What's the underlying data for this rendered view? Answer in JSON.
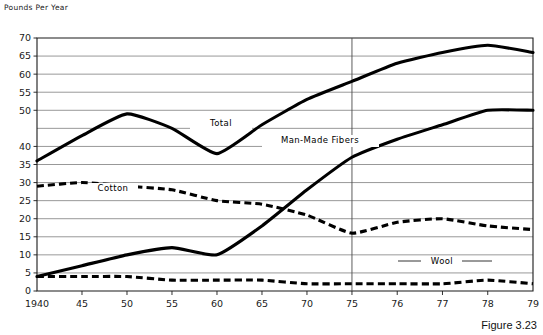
{
  "axis_title": "Pounds Per Year",
  "caption": "Figure 3.23",
  "chart_data": {
    "type": "line",
    "title": "",
    "subtitle": "",
    "xlabel": "",
    "ylabel": "Pounds Per Year",
    "ylim": [
      0,
      70
    ],
    "grid": true,
    "legend_position": "inline-annotations",
    "note": "Horizontal axis uses 5-year spacing from 1940 to 1975, then 1-year spacing from 1975 to 1979; a vertical rule marks the 1975 scale change.",
    "x_tick_labels": [
      "1940",
      "45",
      "50",
      "55",
      "60",
      "65",
      "70",
      "75",
      "76",
      "77",
      "78",
      "79"
    ],
    "x_values": [
      1940,
      1945,
      1950,
      1955,
      1960,
      1965,
      1970,
      1975,
      1976,
      1977,
      1978,
      1979
    ],
    "y_tick_labels": [
      "0",
      "5",
      "10",
      "15",
      "20",
      "25",
      "30",
      "35",
      "40",
      "50",
      "55",
      "60",
      "65",
      "70"
    ],
    "y_tick_values": [
      0,
      5,
      10,
      15,
      20,
      25,
      30,
      35,
      40,
      50,
      55,
      60,
      65,
      70
    ],
    "y_gridline_values": [
      0,
      5,
      10,
      15,
      20,
      25,
      30,
      35,
      40,
      45,
      50,
      55,
      60,
      65,
      70
    ],
    "divider_x": 1975,
    "series": [
      {
        "name": "Total",
        "style": "solid",
        "label": "Total",
        "values": [
          36,
          43,
          49,
          45,
          38,
          46,
          53,
          58,
          63,
          66,
          68,
          66
        ]
      },
      {
        "name": "Man-Made Fibers",
        "style": "solid",
        "label": "Man-Made Fibers",
        "values": [
          4,
          7,
          10,
          12,
          10,
          18,
          28,
          37,
          42,
          46,
          50,
          50
        ]
      },
      {
        "name": "Cotton",
        "style": "dashed",
        "label": "Cotton",
        "values": [
          29,
          30,
          29,
          28,
          25,
          24,
          21,
          16,
          19,
          20,
          18,
          17
        ]
      },
      {
        "name": "Wool",
        "style": "dashed",
        "label": "Wool",
        "values": [
          4,
          4,
          4,
          3,
          3,
          3,
          2,
          2,
          2,
          2,
          3,
          2
        ]
      }
    ]
  }
}
